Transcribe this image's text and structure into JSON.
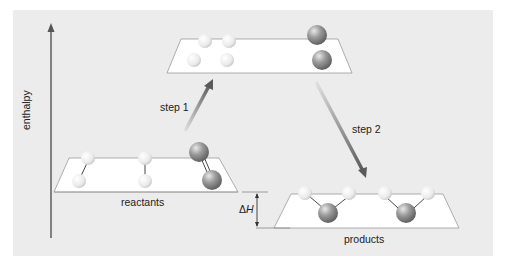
{
  "diagram": {
    "type": "enthalpy-level-diagram",
    "axis": {
      "label": "enthalpy",
      "direction": "up"
    },
    "levels": [
      {
        "id": "reactants",
        "label": "reactants",
        "position": "lower-left"
      },
      {
        "id": "intermediate",
        "label": "",
        "position": "top-center"
      },
      {
        "id": "products",
        "label": "products",
        "position": "lower-right"
      }
    ],
    "steps": [
      {
        "label": "step 1",
        "from": "reactants",
        "to": "intermediate",
        "direction": "up"
      },
      {
        "label": "step 2",
        "from": "intermediate",
        "to": "products",
        "direction": "down"
      }
    ],
    "delta_h": {
      "symbol": "Δ",
      "variable": "H"
    },
    "colors": {
      "background": "#ececec",
      "plane": "#ffffff",
      "light_atom": "#f4f4f4",
      "dark_atom": "#8a8a8a",
      "arrow": "#6a6a6a"
    }
  }
}
